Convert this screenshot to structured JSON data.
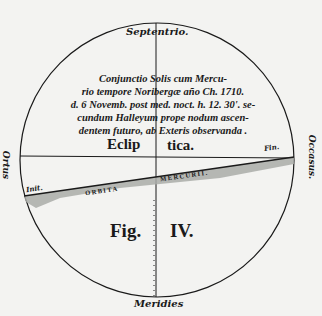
{
  "diagram": {
    "labels": {
      "top": "Septentrio.",
      "bottom": "Meridies",
      "left": "Ortus",
      "right": "Occasus.",
      "ecliptic_left": "Eclip",
      "ecliptic_right": "tica.",
      "orbit_start": "Init.",
      "orbit_end": "Fin.",
      "orbit_left": "ORBITA",
      "orbit_right": "MERCURII.",
      "fig_left": "Fig.",
      "fig_right": "IV."
    },
    "caption_lines": [
      "Conjunctio Solis cum Mercu-",
      "rio tempore Noribergæ año Ch. 1710.",
      "d. 6 Novemb. post med. noct. h. 12. 30'. se-",
      "cundum Halleyum prope nodum ascen-",
      "dentem futuro, ab Exteris observanda ."
    ],
    "colors": {
      "ink": "#1a1a1a",
      "paper": "#f3f3f1",
      "orbit_shade": "#a9aba8"
    }
  }
}
